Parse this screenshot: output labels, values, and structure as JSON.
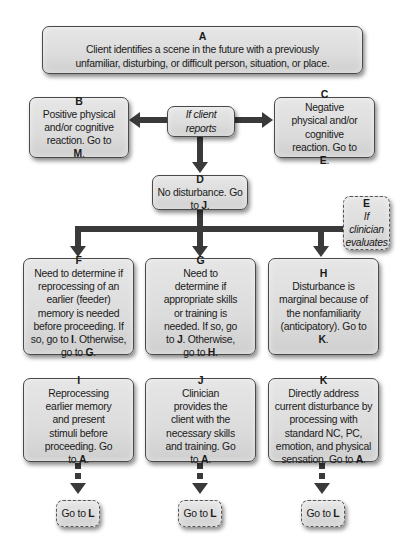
{
  "nodes": {
    "A": {
      "letter": "A",
      "text": "Client identifies a scene in the future with a previously unfamiliar, disturbing, or difficult person, situation, or place."
    },
    "B": {
      "letter": "B",
      "text": "Positive physical and/or cognitive reaction. Go to ",
      "target": "M",
      "end": "."
    },
    "decision_client": {
      "text": "If client reports"
    },
    "C": {
      "letter": "C",
      "text": "Negative physical and/or cognitive reaction. Go to ",
      "target": "E",
      "end": "."
    },
    "D": {
      "letter": "D",
      "text": "No disturbance. Go to ",
      "target": "J",
      "end": "."
    },
    "E": {
      "letter": "E",
      "text": "If clinician evaluates"
    },
    "F": {
      "letter": "F",
      "text": "Need to determine if reprocessing of an earlier (feeder) memory is needed before proceeding. If so, go to ",
      "target1": "I",
      "mid": ". Otherwise, go to ",
      "target2": "G",
      "end": "."
    },
    "G": {
      "letter": "G",
      "text": "Need to determine if appropriate skills or training is needed. If so, go to ",
      "target1": "J",
      "mid": ". Otherwise, go to ",
      "target2": "H",
      "end": "."
    },
    "H": {
      "letter": "H",
      "text": "Disturbance is marginal because of the nonfamiliarity (anticipatory). Go to ",
      "target": "K",
      "end": "."
    },
    "I": {
      "letter": "I",
      "text": "Reprocessing earlier memory and present stimuli before proceeding. Go to ",
      "target": "A",
      "end": "."
    },
    "J": {
      "letter": "J",
      "text": "Clinician provides the client with the necessary skills and training. Go to ",
      "target": "A",
      "end": "."
    },
    "K": {
      "letter": "K",
      "text": "Directly address current disturbance by processing with standard NC, PC, emotion, and physical sensation. Go to ",
      "target": "A",
      "end": "."
    },
    "L1": {
      "text": "Go to ",
      "target": "L"
    },
    "L2": {
      "text": "Go to ",
      "target": "L"
    },
    "L3": {
      "text": "Go to ",
      "target": "L"
    }
  },
  "edges": [
    {
      "from": "A",
      "to": "decision_client",
      "style": "solid"
    },
    {
      "from": "decision_client",
      "to": "B",
      "style": "solid"
    },
    {
      "from": "decision_client",
      "to": "C",
      "style": "solid"
    },
    {
      "from": "decision_client",
      "to": "D",
      "style": "solid"
    },
    {
      "from": "D",
      "to": "G",
      "style": "solid"
    },
    {
      "from": "E",
      "to": "F",
      "style": "solid"
    },
    {
      "from": "E",
      "to": "G",
      "style": "solid"
    },
    {
      "from": "E",
      "to": "H",
      "style": "solid"
    },
    {
      "from": "I",
      "to": "L1",
      "style": "dashed"
    },
    {
      "from": "J",
      "to": "L2",
      "style": "dashed"
    },
    {
      "from": "K",
      "to": "L3",
      "style": "dashed"
    }
  ],
  "colors": {
    "box_fill": "#dcdcdc",
    "box_border": "#4a4a4a",
    "arrow": "#3a3a3a",
    "background": "#ffffff"
  }
}
